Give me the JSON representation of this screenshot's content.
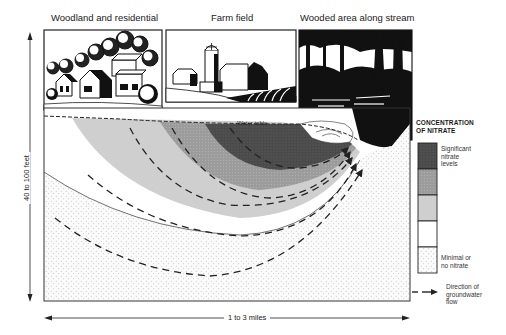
{
  "diagram": {
    "panels": [
      {
        "label": "Woodland and residential"
      },
      {
        "label": "Farm field"
      },
      {
        "label": "Wooded area along stream"
      }
    ],
    "water_table_label": "Water table",
    "vertical_scale_label": "40 to 100 feet",
    "horizontal_scale_label": "1 to 3 miles"
  },
  "legend": {
    "title_line1": "CONCENTRATION",
    "title_line2": "OF NITRATE",
    "high_label_line1": "Significant",
    "high_label_line2": "nitrate",
    "high_label_line3": "levels",
    "low_label_line1": "Minimal or",
    "low_label_line2": "no nitrate",
    "swatches": [
      {
        "level": "highest",
        "color": "#5a5a5a"
      },
      {
        "level": "high",
        "color": "#9a9a9a"
      },
      {
        "level": "medium",
        "color": "#cfcfcf"
      },
      {
        "level": "low",
        "color": "#ffffff"
      },
      {
        "level": "minimal",
        "color": "#f4f4f4"
      }
    ],
    "flow_line1": "Direction of",
    "flow_line2": "groundwater",
    "flow_line3": "flow"
  }
}
